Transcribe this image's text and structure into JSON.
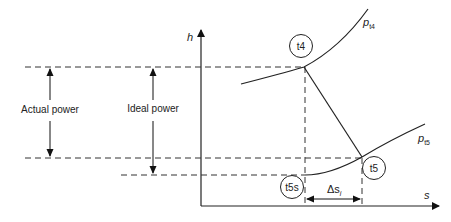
{
  "diagram": {
    "type": "h-s (Mollier) diagram - turbine expansion",
    "axes": {
      "y_label": "h",
      "x_label": "s"
    },
    "isobars": [
      {
        "name": "p_t4",
        "label_main": "p",
        "label_sub": "t4"
      },
      {
        "name": "p_t5",
        "label_main": "p",
        "label_sub": "t5"
      }
    ],
    "points": {
      "t4": "t4",
      "t5": "t5",
      "t5s": "t5s"
    },
    "annotations": {
      "actual_power": "Actual power",
      "ideal_power": "Ideal power",
      "delta_s_main": "Δs",
      "delta_s_sub": "i"
    },
    "colors": {
      "line": "#222222",
      "background": "#ffffff"
    }
  }
}
